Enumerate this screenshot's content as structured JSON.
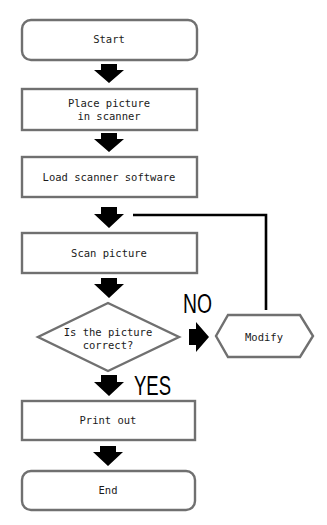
{
  "diagram": {
    "type": "flowchart",
    "nodes": [
      {
        "id": "start",
        "shape": "terminator",
        "label": "Start"
      },
      {
        "id": "place",
        "shape": "process",
        "line1": "Place picture",
        "line2": "in scanner"
      },
      {
        "id": "load",
        "shape": "process",
        "label": "Load scanner software"
      },
      {
        "id": "scan",
        "shape": "process",
        "label": "Scan picture"
      },
      {
        "id": "decision",
        "shape": "decision",
        "line1": "Is the picture",
        "line2": "correct?"
      },
      {
        "id": "modify",
        "shape": "preparation",
        "label": "Modify"
      },
      {
        "id": "print",
        "shape": "process",
        "label": "Print out"
      },
      {
        "id": "end",
        "shape": "terminator",
        "label": "End"
      }
    ],
    "branch_labels": {
      "no": "NO",
      "yes": "YES"
    },
    "edges": [
      {
        "from": "start",
        "to": "place"
      },
      {
        "from": "place",
        "to": "load"
      },
      {
        "from": "load",
        "to": "scan"
      },
      {
        "from": "scan",
        "to": "decision"
      },
      {
        "from": "decision",
        "to": "modify",
        "label": "NO"
      },
      {
        "from": "modify",
        "to": "scan",
        "note": "loop back above Scan picture"
      },
      {
        "from": "decision",
        "to": "print",
        "label": "YES"
      },
      {
        "from": "print",
        "to": "end"
      }
    ],
    "colors": {
      "box_stroke": "#707070",
      "arrow_fill": "#000000",
      "background": "#ffffff"
    }
  }
}
